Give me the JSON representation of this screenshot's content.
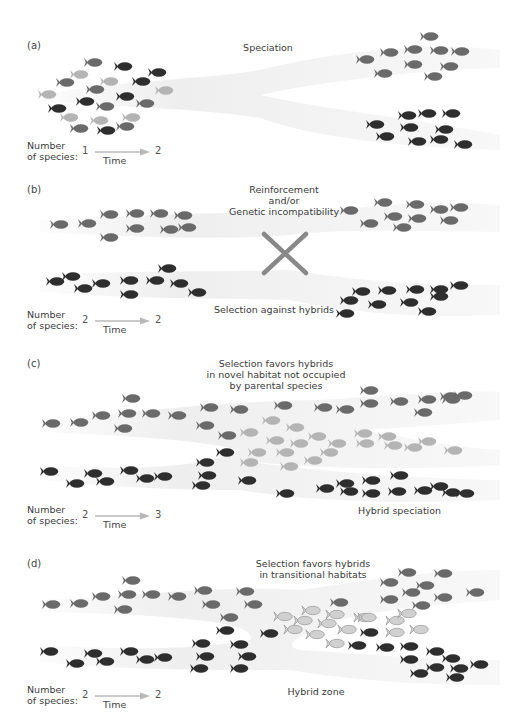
{
  "figure": {
    "colors": {
      "dark": "#2e2e2e",
      "mid": "#6a6a6a",
      "light": "#b4b4b4",
      "hybrid_fill": "#d0d0d0",
      "hybrid_outline": "#9a9a9a",
      "band": "#f1f1f1",
      "arrow": "#b8b8b8",
      "cross": "#888888"
    },
    "common": {
      "number_label_line1": "Number",
      "number_label_line2": "of species:",
      "time_label": "Time"
    },
    "panels": [
      {
        "id": "a",
        "letter": "(a)",
        "title": "Speciation",
        "species_before": "1",
        "species_after": "2",
        "fish": [
          [
            94,
            62,
            "mid"
          ],
          [
            124,
            66,
            "dark"
          ],
          [
            158,
            72,
            "dark"
          ],
          [
            80,
            74,
            "light"
          ],
          [
            66,
            82,
            "mid"
          ],
          [
            110,
            81,
            "light"
          ],
          [
            142,
            81,
            "dark"
          ],
          [
            48,
            94,
            "light"
          ],
          [
            96,
            89,
            "mid"
          ],
          [
            165,
            90,
            "light"
          ],
          [
            58,
            108,
            "dark"
          ],
          [
            86,
            101,
            "dark"
          ],
          [
            106,
            106,
            "mid"
          ],
          [
            126,
            96,
            "dark"
          ],
          [
            146,
            103,
            "mid"
          ],
          [
            70,
            117,
            "light"
          ],
          [
            100,
            120,
            "light"
          ],
          [
            132,
            117,
            "light"
          ],
          [
            80,
            128,
            "mid"
          ],
          [
            107,
            130,
            "dark"
          ],
          [
            126,
            126,
            "mid"
          ],
          [
            430,
            36,
            "mid"
          ],
          [
            390,
            52,
            "mid"
          ],
          [
            414,
            49,
            "mid"
          ],
          [
            440,
            50,
            "mid"
          ],
          [
            461,
            51,
            "mid"
          ],
          [
            366,
            59,
            "mid"
          ],
          [
            414,
            64,
            "mid"
          ],
          [
            450,
            66,
            "mid"
          ],
          [
            384,
            73,
            "mid"
          ],
          [
            434,
            76,
            "mid"
          ],
          [
            376,
            124,
            "dark"
          ],
          [
            408,
            115,
            "dark"
          ],
          [
            428,
            113,
            "dark"
          ],
          [
            452,
            113,
            "dark"
          ],
          [
            410,
            127,
            "dark"
          ],
          [
            445,
            129,
            "dark"
          ],
          [
            386,
            136,
            "dark"
          ],
          [
            418,
            141,
            "dark"
          ],
          [
            440,
            139,
            "dark"
          ],
          [
            464,
            144,
            "dark"
          ]
        ]
      },
      {
        "id": "b",
        "letter": "(b)",
        "title_line1": "Reinforcement",
        "title_line2": "and/or",
        "title_line3": "Genetic incompatibility",
        "bottom_caption": "Selection against hybrids",
        "species_before": "2",
        "species_after": "2",
        "fish": [
          [
            60,
            224,
            "mid"
          ],
          [
            88,
            223,
            "mid"
          ],
          [
            110,
            214,
            "mid"
          ],
          [
            136,
            213,
            "mid"
          ],
          [
            160,
            213,
            "mid"
          ],
          [
            184,
            215,
            "mid"
          ],
          [
            136,
            228,
            "mid"
          ],
          [
            170,
            229,
            "mid"
          ],
          [
            188,
            227,
            "mid"
          ],
          [
            110,
            237,
            "mid"
          ],
          [
            350,
            210,
            "mid"
          ],
          [
            384,
            202,
            "mid"
          ],
          [
            416,
            204,
            "mid"
          ],
          [
            440,
            209,
            "mid"
          ],
          [
            460,
            207,
            "mid"
          ],
          [
            370,
            223,
            "mid"
          ],
          [
            394,
            216,
            "mid"
          ],
          [
            418,
            218,
            "mid"
          ],
          [
            450,
            220,
            "mid"
          ],
          [
            403,
            227,
            "mid"
          ],
          [
            56,
            281,
            "dark"
          ],
          [
            72,
            276,
            "dark"
          ],
          [
            84,
            288,
            "dark"
          ],
          [
            102,
            283,
            "dark"
          ],
          [
            130,
            280,
            "dark"
          ],
          [
            156,
            280,
            "dark"
          ],
          [
            168,
            268,
            "dark"
          ],
          [
            180,
            283,
            "dark"
          ],
          [
            198,
            292,
            "dark"
          ],
          [
            130,
            294,
            "dark"
          ],
          [
            350,
            300,
            "dark"
          ],
          [
            362,
            291,
            "dark"
          ],
          [
            388,
            290,
            "dark"
          ],
          [
            416,
            289,
            "dark"
          ],
          [
            440,
            289,
            "dark"
          ],
          [
            460,
            285,
            "dark"
          ],
          [
            378,
            304,
            "dark"
          ],
          [
            410,
            302,
            "dark"
          ],
          [
            440,
            296,
            "dark"
          ],
          [
            428,
            311,
            "dark"
          ],
          [
            346,
            313,
            "dark"
          ]
        ]
      },
      {
        "id": "c",
        "letter": "(c)",
        "title_line1": "Selection favors hybrids",
        "title_line2": "in novel habitat not occupied",
        "title_line3": "by parental species",
        "bottom_caption": "Hybrid speciation",
        "species_before": "2",
        "species_after": "3",
        "fish": [
          [
            132,
            398,
            "mid"
          ],
          [
            52,
            423,
            "mid"
          ],
          [
            80,
            422,
            "mid"
          ],
          [
            102,
            415,
            "mid"
          ],
          [
            128,
            413,
            "mid"
          ],
          [
            152,
            413,
            "mid"
          ],
          [
            178,
            415,
            "mid"
          ],
          [
            124,
            428,
            "mid"
          ],
          [
            210,
            407,
            "mid"
          ],
          [
            240,
            409,
            "mid"
          ],
          [
            284,
            405,
            "mid"
          ],
          [
            206,
            425,
            "mid"
          ],
          [
            228,
            435,
            "mid"
          ],
          [
            370,
            390,
            "mid"
          ],
          [
            400,
            401,
            "mid"
          ],
          [
            428,
            399,
            "mid"
          ],
          [
            452,
            399,
            "mid"
          ],
          [
            464,
            395,
            "mid"
          ],
          [
            324,
            407,
            "mid"
          ],
          [
            346,
            409,
            "mid"
          ],
          [
            370,
            403,
            "mid"
          ],
          [
            424,
            412,
            "mid"
          ],
          [
            450,
            396,
            "mid"
          ],
          [
            272,
            420,
            "light"
          ],
          [
            250,
            432,
            "light"
          ],
          [
            296,
            427,
            "light"
          ],
          [
            318,
            436,
            "light"
          ],
          [
            276,
            440,
            "light"
          ],
          [
            300,
            443,
            "light"
          ],
          [
            338,
            443,
            "light"
          ],
          [
            364,
            433,
            "light"
          ],
          [
            388,
            436,
            "light"
          ],
          [
            366,
            443,
            "light"
          ],
          [
            394,
            445,
            "light"
          ],
          [
            414,
            447,
            "light"
          ],
          [
            428,
            441,
            "light"
          ],
          [
            454,
            450,
            "light"
          ],
          [
            258,
            452,
            "light"
          ],
          [
            286,
            452,
            "light"
          ],
          [
            330,
            452,
            "light"
          ],
          [
            250,
            462,
            "light"
          ],
          [
            290,
            466,
            "light"
          ],
          [
            314,
            460,
            "light"
          ],
          [
            226,
            452,
            "dark"
          ],
          [
            206,
            462,
            "dark"
          ],
          [
            208,
            475,
            "dark"
          ],
          [
            202,
            485,
            "dark"
          ],
          [
            248,
            480,
            "dark"
          ],
          [
            50,
            471,
            "dark"
          ],
          [
            76,
            483,
            "dark"
          ],
          [
            94,
            473,
            "dark"
          ],
          [
            106,
            481,
            "dark"
          ],
          [
            130,
            470,
            "dark"
          ],
          [
            146,
            478,
            "dark"
          ],
          [
            164,
            476,
            "dark"
          ],
          [
            286,
            493,
            "dark"
          ],
          [
            326,
            488,
            "dark"
          ],
          [
            346,
            483,
            "dark"
          ],
          [
            372,
            480,
            "dark"
          ],
          [
            400,
            475,
            "dark"
          ],
          [
            372,
            493,
            "dark"
          ],
          [
            398,
            491,
            "dark"
          ],
          [
            424,
            490,
            "dark"
          ],
          [
            440,
            486,
            "dark"
          ],
          [
            452,
            492,
            "dark"
          ],
          [
            466,
            493,
            "dark"
          ],
          [
            350,
            491,
            "dark"
          ]
        ]
      },
      {
        "id": "d",
        "letter": "(d)",
        "title_line1": "Selection favors hybrids",
        "title_line2": "in transitional habitats",
        "bottom_caption": "Hybrid zone",
        "species_before": "2",
        "species_after": "2",
        "fish": [
          [
            132,
            580,
            "mid"
          ],
          [
            52,
            604,
            "mid"
          ],
          [
            80,
            603,
            "mid"
          ],
          [
            102,
            596,
            "mid"
          ],
          [
            128,
            594,
            "mid"
          ],
          [
            152,
            594,
            "mid"
          ],
          [
            178,
            596,
            "mid"
          ],
          [
            124,
            609,
            "mid"
          ],
          [
            204,
            590,
            "mid"
          ],
          [
            212,
            604,
            "mid"
          ],
          [
            246,
            591,
            "mid"
          ],
          [
            254,
            604,
            "mid"
          ],
          [
            230,
            617,
            "mid"
          ],
          [
            408,
            572,
            "mid"
          ],
          [
            444,
            573,
            "mid"
          ],
          [
            390,
            582,
            "mid"
          ],
          [
            426,
            585,
            "mid"
          ],
          [
            412,
            592,
            "mid"
          ],
          [
            444,
            597,
            "mid"
          ],
          [
            476,
            592,
            "mid"
          ],
          [
            390,
            599,
            "mid"
          ],
          [
            422,
            605,
            "mid"
          ],
          [
            340,
            602,
            "mid"
          ],
          [
            284,
            616,
            "light"
          ],
          [
            312,
            610,
            "light"
          ],
          [
            336,
            614,
            "light"
          ],
          [
            304,
            620,
            "light"
          ],
          [
            328,
            623,
            "light"
          ],
          [
            364,
            617,
            "light"
          ],
          [
            396,
            620,
            "light"
          ],
          [
            408,
            613,
            "light"
          ],
          [
            294,
            629,
            "light"
          ],
          [
            316,
            634,
            "light"
          ],
          [
            348,
            629,
            "light"
          ],
          [
            396,
            632,
            "light"
          ],
          [
            420,
            629,
            "light"
          ],
          [
            336,
            643,
            "light"
          ],
          [
            368,
            617,
            "light"
          ],
          [
            226,
            630,
            "dark"
          ],
          [
            270,
            633,
            "dark"
          ],
          [
            370,
            632,
            "dark"
          ],
          [
            202,
            643,
            "dark"
          ],
          [
            240,
            644,
            "dark"
          ],
          [
            206,
            656,
            "dark"
          ],
          [
            248,
            656,
            "dark"
          ],
          [
            200,
            668,
            "dark"
          ],
          [
            240,
            668,
            "dark"
          ],
          [
            50,
            651,
            "dark"
          ],
          [
            76,
            663,
            "dark"
          ],
          [
            94,
            653,
            "dark"
          ],
          [
            106,
            661,
            "dark"
          ],
          [
            130,
            651,
            "dark"
          ],
          [
            146,
            659,
            "dark"
          ],
          [
            164,
            657,
            "dark"
          ],
          [
            358,
            645,
            "dark"
          ],
          [
            386,
            647,
            "dark"
          ],
          [
            410,
            646,
            "dark"
          ],
          [
            436,
            651,
            "dark"
          ],
          [
            410,
            659,
            "dark"
          ],
          [
            452,
            658,
            "dark"
          ],
          [
            480,
            664,
            "dark"
          ],
          [
            436,
            667,
            "dark"
          ],
          [
            420,
            673,
            "dark"
          ],
          [
            456,
            677,
            "dark"
          ],
          [
            460,
            668,
            "dark"
          ]
        ]
      }
    ]
  }
}
